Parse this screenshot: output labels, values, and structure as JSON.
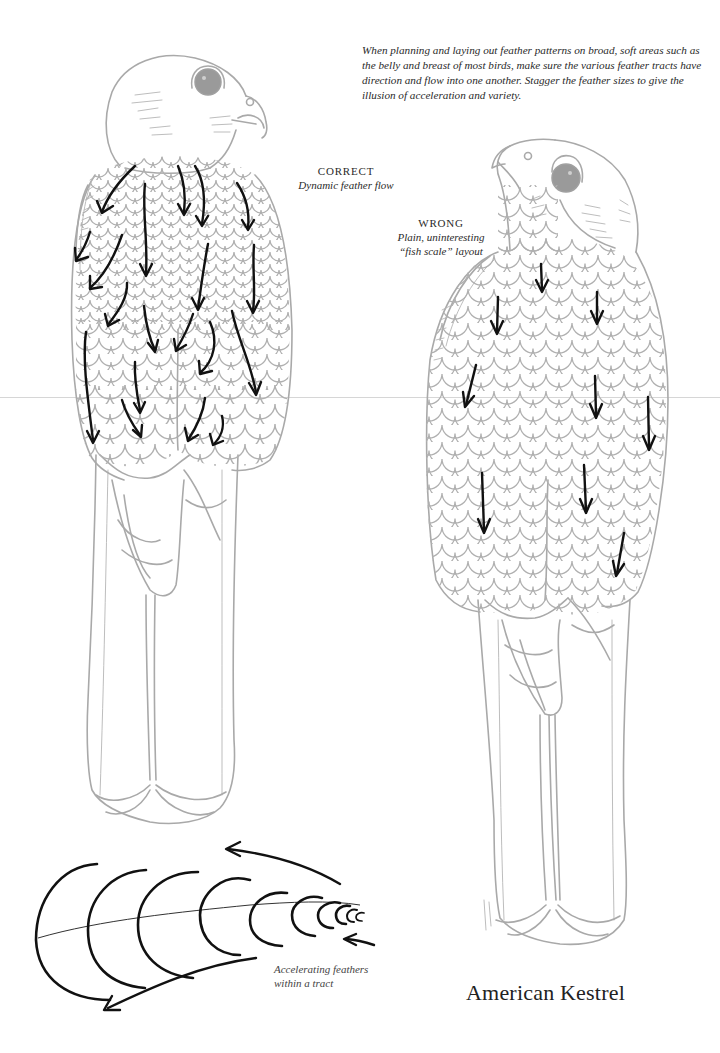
{
  "intro_text": "When planning and laying out feather patterns on broad, soft areas such as the belly and breast of most birds, make sure the various feather tracts have direction and flow into one another. Stagger the feather sizes to give the illusion of acceleration and variety.",
  "correct_label": {
    "heading": "CORRECT",
    "subtitle": "Dynamic feather flow"
  },
  "wrong_label": {
    "heading": "WRONG",
    "subtitle_line1": "Plain, uninteresting",
    "subtitle_line2": "“fish scale” layout"
  },
  "tract_caption": {
    "line1": "Accelerating feathers",
    "line2": "within a tract"
  },
  "title": "American Kestrel",
  "colors": {
    "outline_gray": "#a9a9a9",
    "arrow_black": "#111111",
    "background": "#ffffff"
  },
  "illustrations": [
    {
      "id": "correct-kestrel",
      "view": "front, head turned right",
      "arrow_count": 22
    },
    {
      "id": "wrong-kestrel",
      "view": "front, head turned up-left",
      "arrow_count": 10
    },
    {
      "id": "accelerating-feathers",
      "feather_count": 10,
      "arrow_count": 3
    }
  ]
}
